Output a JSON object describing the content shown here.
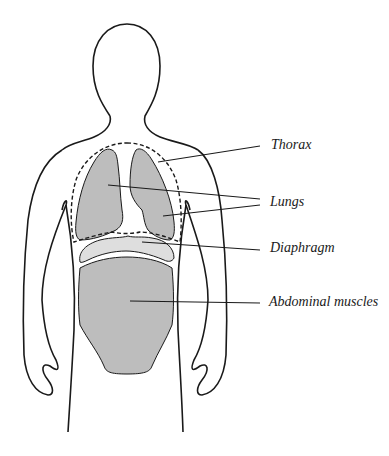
{
  "diagram": {
    "title": "",
    "labels": {
      "thorax": "Thorax",
      "lungs": "Lungs",
      "diaphragm": "Diaphragm",
      "abdominal": "Abdominal muscles"
    },
    "colors": {
      "outline": "#1a1a1a",
      "organ_fill": "#bdbdbd",
      "diaphragm_fill": "#dedede",
      "background": "#ffffff"
    }
  }
}
